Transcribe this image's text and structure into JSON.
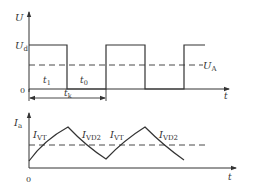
{
  "top_plot": {
    "y_axis_label": "U",
    "x_axis_label": "t",
    "origin_label": "0",
    "level_high_label": "U",
    "level_high_sub": "d",
    "dashed_level_label": "U",
    "dashed_level_sub": "A",
    "interval_on_label": "t",
    "interval_on_sub": "1",
    "interval_off_label": "t",
    "interval_off_sub": "0",
    "period_label": "t",
    "period_sub": "k"
  },
  "bottom_plot": {
    "y_axis_label": "I",
    "y_axis_sub": "a",
    "x_axis_label": "t",
    "origin_label": "0",
    "segment_labels": [
      {
        "main": "I",
        "sub": "VT"
      },
      {
        "main": "I",
        "sub": "VD2"
      },
      {
        "main": "I",
        "sub": "VT"
      },
      {
        "main": "I",
        "sub": "VD2"
      }
    ]
  },
  "colors": {
    "line": "#333333",
    "background": "#ffffff"
  }
}
